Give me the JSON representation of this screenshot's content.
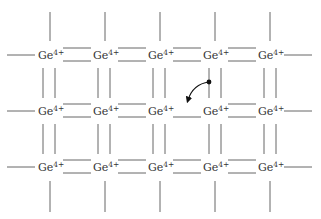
{
  "diagram": {
    "type": "crystal-lattice",
    "ion": {
      "symbol": "Ge",
      "charge": "4+"
    },
    "grid": {
      "rows": 3,
      "cols": 5
    },
    "colors": {
      "line": "#555555",
      "text": "#333333",
      "electron": "#111111"
    },
    "broken_bond": {
      "row": 1,
      "between_cols": [
        2,
        3
      ],
      "missing_line": "upper"
    },
    "electron": {
      "description": "electron leaving bond below ion (row 0, col 3) to fill the hole",
      "arrow": "curved"
    }
  },
  "labels": {
    "r0c0": "Ge",
    "r0c1": "Ge",
    "r0c2": "Ge",
    "r0c3": "Ge",
    "r0c4": "Ge",
    "r1c0": "Ge",
    "r1c1": "Ge",
    "r1c2": "Ge",
    "r1c3": "Ge",
    "r1c4": "Ge",
    "r2c0": "Ge",
    "r2c1": "Ge",
    "r2c2": "Ge",
    "r2c3": "Ge",
    "r2c4": "Ge",
    "charge": "4+"
  }
}
